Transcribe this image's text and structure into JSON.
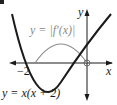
{
  "diagram": {
    "curve1_label": "y = x(x + 2)",
    "curve2_label": "y = |f′(x)|",
    "x_axis_label": "x",
    "y_axis_label": "y",
    "tick_label_neg2": "−2",
    "colors": {
      "curve1": "#1a1a1a",
      "curve2": "#8a8a8a",
      "axes": "#1a1a1a",
      "label_gray": "#8a8a8a"
    }
  }
}
